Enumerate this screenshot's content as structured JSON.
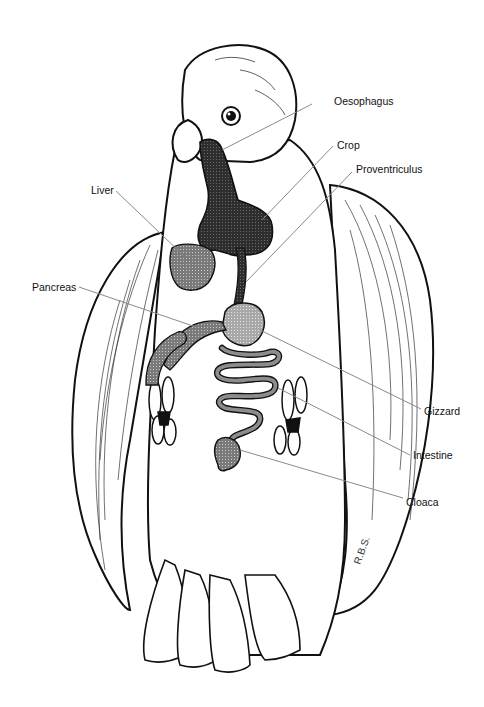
{
  "diagram": {
    "line_color": "#8a8a8a",
    "ink_color": "#111111",
    "dark_organ_color": "#3a3a3a",
    "mid_organ_color": "#8c8c8c",
    "light_organ_color": "#b5b5b5",
    "labels": {
      "oesophagus": "Oesophagus",
      "crop": "Crop",
      "proventriculus": "Proventriculus",
      "liver": "Liver",
      "pancreas": "Pancreas",
      "gizzard": "Gizzard",
      "intestine": "Intestine",
      "cloaca": "Cloaca"
    }
  }
}
